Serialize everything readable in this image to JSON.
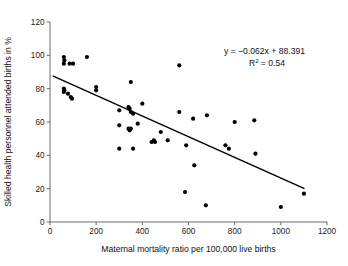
{
  "chart_data": {
    "type": "scatter",
    "title": "",
    "xlabel": "Maternal mortality ratio per 100,000 live births",
    "ylabel": "Skilled health personnel attended births in %",
    "xlim": [
      0,
      1200
    ],
    "ylim": [
      0,
      120
    ],
    "xticks": [
      0,
      200,
      400,
      600,
      800,
      1000,
      1200
    ],
    "yticks": [
      0,
      20,
      40,
      60,
      80,
      100,
      120
    ],
    "grid": false,
    "legend": null,
    "annotations": {
      "equation": "y = −0.062x + 88.391",
      "r_squared_label": "R",
      "r_squared_exponent": "2",
      "r_squared_value": " = 0.54"
    },
    "trendline": {
      "slope": -0.062,
      "intercept": 88.391,
      "r_squared": 0.54,
      "x_start": 14,
      "x_end": 1100
    },
    "points": [
      {
        "x": 60,
        "y": 99
      },
      {
        "x": 62,
        "y": 97
      },
      {
        "x": 60,
        "y": 95
      },
      {
        "x": 85,
        "y": 95
      },
      {
        "x": 100,
        "y": 95
      },
      {
        "x": 160,
        "y": 99
      },
      {
        "x": 60,
        "y": 80
      },
      {
        "x": 62,
        "y": 79
      },
      {
        "x": 60,
        "y": 78
      },
      {
        "x": 78,
        "y": 77
      },
      {
        "x": 90,
        "y": 75
      },
      {
        "x": 95,
        "y": 74
      },
      {
        "x": 200,
        "y": 81
      },
      {
        "x": 200,
        "y": 79
      },
      {
        "x": 350,
        "y": 84
      },
      {
        "x": 300,
        "y": 67
      },
      {
        "x": 340,
        "y": 69
      },
      {
        "x": 345,
        "y": 68
      },
      {
        "x": 350,
        "y": 66
      },
      {
        "x": 360,
        "y": 65
      },
      {
        "x": 400,
        "y": 71
      },
      {
        "x": 300,
        "y": 58
      },
      {
        "x": 340,
        "y": 56
      },
      {
        "x": 345,
        "y": 55
      },
      {
        "x": 350,
        "y": 56
      },
      {
        "x": 380,
        "y": 59
      },
      {
        "x": 300,
        "y": 44
      },
      {
        "x": 360,
        "y": 44
      },
      {
        "x": 440,
        "y": 48
      },
      {
        "x": 450,
        "y": 49
      },
      {
        "x": 455,
        "y": 48
      },
      {
        "x": 480,
        "y": 54
      },
      {
        "x": 510,
        "y": 49
      },
      {
        "x": 560,
        "y": 94
      },
      {
        "x": 560,
        "y": 66
      },
      {
        "x": 590,
        "y": 46
      },
      {
        "x": 620,
        "y": 62
      },
      {
        "x": 625,
        "y": 34
      },
      {
        "x": 585,
        "y": 18
      },
      {
        "x": 675,
        "y": 10
      },
      {
        "x": 680,
        "y": 64
      },
      {
        "x": 760,
        "y": 46
      },
      {
        "x": 775,
        "y": 44
      },
      {
        "x": 800,
        "y": 60
      },
      {
        "x": 885,
        "y": 61
      },
      {
        "x": 890,
        "y": 41
      },
      {
        "x": 1000,
        "y": 9
      },
      {
        "x": 1100,
        "y": 17
      }
    ]
  }
}
